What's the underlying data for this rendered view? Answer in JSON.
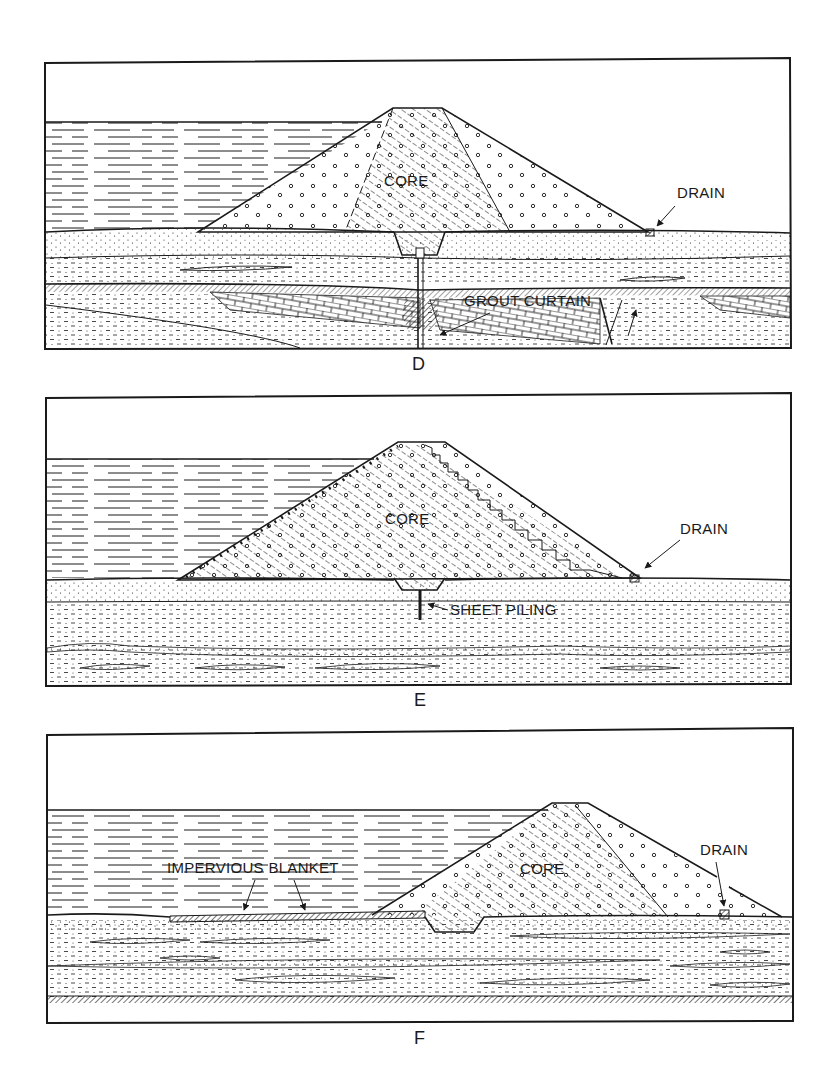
{
  "figure": {
    "panels": [
      {
        "id": "D",
        "caption": "D",
        "labels": {
          "core": "CORE",
          "drain": "DRAIN",
          "grout_curtain": "GROUT CURTAIN"
        }
      },
      {
        "id": "E",
        "caption": "E",
        "labels": {
          "core": "CORE",
          "drain": "DRAIN",
          "sheet_piling": "SHEET PILING"
        }
      },
      {
        "id": "F",
        "caption": "F",
        "labels": {
          "core": "CORE",
          "drain": "DRAIN",
          "impervious_blanket": "IMPERVIOUS BLANKET"
        }
      }
    ],
    "colors": {
      "ink": "#1a1a1a",
      "paper": "#ffffff"
    }
  }
}
